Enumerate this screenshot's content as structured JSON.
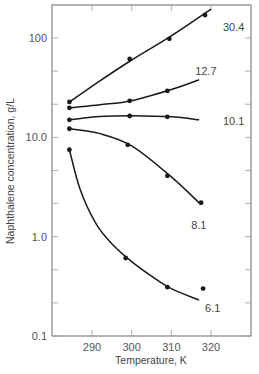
{
  "chart_data": {
    "type": "line",
    "title": "",
    "xlabel": "Temperature, K",
    "ylabel": "Naphthalene concentration, g/L",
    "xscale": "linear",
    "yscale": "log",
    "xlim": [
      280,
      330
    ],
    "ylim": [
      0.1,
      230
    ],
    "xticks": [
      290,
      300,
      310,
      320
    ],
    "xtick_labels": [
      "290",
      "300",
      "310",
      "320"
    ],
    "yticks": [
      0.1,
      1.0,
      10.0,
      100
    ],
    "ytick_labels": [
      "0.1",
      "1.0",
      "10.0",
      "100"
    ],
    "grid": false,
    "legend": "none (series labeled inline at right end of curves)",
    "series": [
      {
        "name": "30.4",
        "points": [
          [
            284.3,
            22.7
          ],
          [
            299.5,
            61.5
          ],
          [
            309.5,
            98
          ],
          [
            318.5,
            170
          ]
        ],
        "curve": [
          [
            284.3,
            22.7
          ],
          [
            292,
            37
          ],
          [
            300,
            60
          ],
          [
            310,
            105
          ],
          [
            320,
            195
          ]
        ],
        "label_pos": [
          323,
          130
        ]
      },
      {
        "name": "12.7",
        "points": [
          [
            284.3,
            19.8
          ],
          [
            299.5,
            23.3
          ],
          [
            309,
            29.3
          ]
        ],
        "curve": [
          [
            284.3,
            19.8
          ],
          [
            292,
            21.3
          ],
          [
            300,
            23.4
          ],
          [
            310,
            30.3
          ],
          [
            317,
            38
          ]
        ],
        "label_pos": [
          316,
          47
        ]
      },
      {
        "name": "10.1",
        "points": [
          [
            284.3,
            15.0
          ],
          [
            299.5,
            16.4
          ],
          [
            309,
            16.1
          ]
        ],
        "curve": [
          [
            284.3,
            15.0
          ],
          [
            292,
            16.2
          ],
          [
            300,
            16.5
          ],
          [
            310,
            16.1
          ],
          [
            317,
            15.0
          ]
        ],
        "label_pos": [
          323,
          14.5
        ]
      },
      {
        "name": "8.1",
        "points": [
          [
            284.3,
            12.2
          ],
          [
            299,
            8.4
          ],
          [
            309,
            4.1
          ],
          [
            317.5,
            2.2
          ]
        ],
        "curve": [
          [
            284.3,
            12.2
          ],
          [
            292,
            10.9
          ],
          [
            300,
            8.2
          ],
          [
            310,
            4.0
          ],
          [
            317.5,
            2.1
          ]
        ],
        "label_pos": [
          315,
          1.3
        ]
      },
      {
        "name": "6.1",
        "points": [
          [
            284.3,
            7.5
          ],
          [
            298.5,
            0.61
          ],
          [
            309,
            0.31
          ],
          [
            318,
            0.3
          ]
        ],
        "curve": [
          [
            284.3,
            7.5
          ],
          [
            287,
            3.0
          ],
          [
            291,
            1.35
          ],
          [
            295,
            0.85
          ],
          [
            300,
            0.56
          ],
          [
            305,
            0.4
          ],
          [
            310,
            0.3
          ],
          [
            317,
            0.23
          ]
        ],
        "label_pos": [
          318.5,
          0.19
        ]
      }
    ]
  },
  "labels": {
    "series": [
      "30.4",
      "12.7",
      "10.1",
      "8.1",
      "6.1"
    ]
  }
}
